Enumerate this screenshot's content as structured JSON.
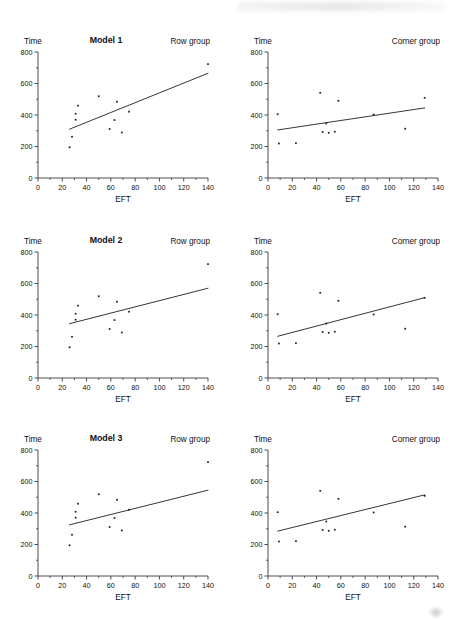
{
  "figure": {
    "axis_labels": {
      "y": "Time",
      "x": "EFT"
    },
    "group_labels": {
      "row": "Row group",
      "corner": "Corner group"
    },
    "model_titles": [
      "Model 1",
      "Model 2",
      "Model 3"
    ],
    "ink_color": "#1a1a1a",
    "line_color": "#2b2b2b",
    "background": "#ffffff"
  },
  "axes": {
    "x": {
      "min": 0,
      "max": 140,
      "ticks": [
        0,
        20,
        40,
        60,
        80,
        100,
        120,
        140
      ],
      "minor_step": 10
    },
    "y": {
      "min": 0,
      "max": 800,
      "ticks": [
        0,
        200,
        400,
        600,
        800
      ],
      "minor_step": 100
    }
  },
  "chart_data": [
    {
      "type": "scatter",
      "title": "Model 1",
      "subtitle": "Row group",
      "xlabel": "EFT",
      "ylabel": "Time",
      "xlim": [
        0,
        140
      ],
      "ylim": [
        0,
        800
      ],
      "grid": false,
      "points": [
        {
          "x": 26,
          "y": 195
        },
        {
          "x": 28,
          "y": 262
        },
        {
          "x": 31,
          "y": 370
        },
        {
          "x": 31,
          "y": 408
        },
        {
          "x": 33,
          "y": 459
        },
        {
          "x": 50,
          "y": 519
        },
        {
          "x": 59,
          "y": 311
        },
        {
          "x": 63,
          "y": 368
        },
        {
          "x": 65,
          "y": 484
        },
        {
          "x": 69,
          "y": 289
        },
        {
          "x": 75,
          "y": 421
        },
        {
          "x": 140,
          "y": 723
        }
      ],
      "fit_line": {
        "x1": 26,
        "y1": 310,
        "x2": 140,
        "y2": 665
      }
    },
    {
      "type": "scatter",
      "title": "Model 1",
      "subtitle": "Corner group",
      "xlabel": "EFT",
      "ylabel": "Time",
      "xlim": [
        0,
        140
      ],
      "ylim": [
        0,
        800
      ],
      "grid": false,
      "points": [
        {
          "x": 8,
          "y": 405
        },
        {
          "x": 9,
          "y": 219
        },
        {
          "x": 23,
          "y": 221
        },
        {
          "x": 43,
          "y": 541
        },
        {
          "x": 45,
          "y": 292
        },
        {
          "x": 48,
          "y": 346
        },
        {
          "x": 50,
          "y": 287
        },
        {
          "x": 55,
          "y": 294
        },
        {
          "x": 58,
          "y": 490
        },
        {
          "x": 87,
          "y": 403
        },
        {
          "x": 113,
          "y": 313
        },
        {
          "x": 129,
          "y": 509
        }
      ],
      "fit_line": {
        "x1": 8,
        "y1": 305,
        "x2": 129,
        "y2": 445
      }
    },
    {
      "type": "scatter",
      "title": "Model 2",
      "subtitle": "Row group",
      "xlabel": "EFT",
      "ylabel": "Time",
      "xlim": [
        0,
        140
      ],
      "ylim": [
        0,
        800
      ],
      "grid": false,
      "points": [
        {
          "x": 26,
          "y": 195
        },
        {
          "x": 28,
          "y": 262
        },
        {
          "x": 31,
          "y": 370
        },
        {
          "x": 31,
          "y": 408
        },
        {
          "x": 33,
          "y": 459
        },
        {
          "x": 50,
          "y": 519
        },
        {
          "x": 59,
          "y": 311
        },
        {
          "x": 63,
          "y": 368
        },
        {
          "x": 65,
          "y": 484
        },
        {
          "x": 69,
          "y": 289
        },
        {
          "x": 75,
          "y": 421
        },
        {
          "x": 140,
          "y": 723
        }
      ],
      "fit_line": {
        "x1": 26,
        "y1": 345,
        "x2": 140,
        "y2": 570
      }
    },
    {
      "type": "scatter",
      "title": "Model 2",
      "subtitle": "Corner group",
      "xlabel": "EFT",
      "ylabel": "Time",
      "xlim": [
        0,
        140
      ],
      "ylim": [
        0,
        800
      ],
      "grid": false,
      "points": [
        {
          "x": 8,
          "y": 405
        },
        {
          "x": 9,
          "y": 219
        },
        {
          "x": 23,
          "y": 221
        },
        {
          "x": 43,
          "y": 541
        },
        {
          "x": 45,
          "y": 292
        },
        {
          "x": 48,
          "y": 346
        },
        {
          "x": 50,
          "y": 287
        },
        {
          "x": 55,
          "y": 294
        },
        {
          "x": 58,
          "y": 490
        },
        {
          "x": 87,
          "y": 403
        },
        {
          "x": 113,
          "y": 313
        },
        {
          "x": 129,
          "y": 509
        }
      ],
      "fit_line": {
        "x1": 8,
        "y1": 265,
        "x2": 129,
        "y2": 510
      }
    },
    {
      "type": "scatter",
      "title": "Model 3",
      "subtitle": "Row group",
      "xlabel": "EFT",
      "ylabel": "Time",
      "xlim": [
        0,
        140
      ],
      "ylim": [
        0,
        800
      ],
      "grid": false,
      "points": [
        {
          "x": 26,
          "y": 195
        },
        {
          "x": 28,
          "y": 262
        },
        {
          "x": 31,
          "y": 370
        },
        {
          "x": 31,
          "y": 408
        },
        {
          "x": 33,
          "y": 459
        },
        {
          "x": 50,
          "y": 519
        },
        {
          "x": 59,
          "y": 311
        },
        {
          "x": 63,
          "y": 368
        },
        {
          "x": 65,
          "y": 484
        },
        {
          "x": 69,
          "y": 289
        },
        {
          "x": 75,
          "y": 421
        },
        {
          "x": 140,
          "y": 723
        }
      ],
      "fit_line": {
        "x1": 26,
        "y1": 325,
        "x2": 140,
        "y2": 545
      }
    },
    {
      "type": "scatter",
      "title": "Model 3",
      "subtitle": "Corner group",
      "xlabel": "EFT",
      "ylabel": "Time",
      "xlim": [
        0,
        140
      ],
      "ylim": [
        0,
        800
      ],
      "grid": false,
      "points": [
        {
          "x": 8,
          "y": 405
        },
        {
          "x": 9,
          "y": 219
        },
        {
          "x": 23,
          "y": 221
        },
        {
          "x": 43,
          "y": 541
        },
        {
          "x": 45,
          "y": 292
        },
        {
          "x": 48,
          "y": 346
        },
        {
          "x": 50,
          "y": 287
        },
        {
          "x": 55,
          "y": 294
        },
        {
          "x": 58,
          "y": 490
        },
        {
          "x": 87,
          "y": 403
        },
        {
          "x": 113,
          "y": 313
        },
        {
          "x": 129,
          "y": 509
        }
      ],
      "fit_line": {
        "x1": 8,
        "y1": 285,
        "x2": 129,
        "y2": 515
      }
    }
  ]
}
